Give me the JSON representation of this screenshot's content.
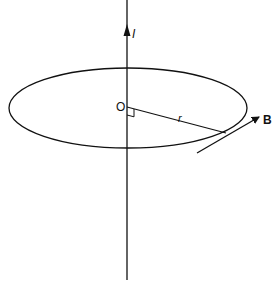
{
  "diagram": {
    "type": "magnetic field around a straight current-carrying wire",
    "labels": {
      "current": "I",
      "origin": "O",
      "radius": "r",
      "field": "B"
    },
    "colors": {
      "stroke": "#111111",
      "background": "#ffffff"
    }
  }
}
